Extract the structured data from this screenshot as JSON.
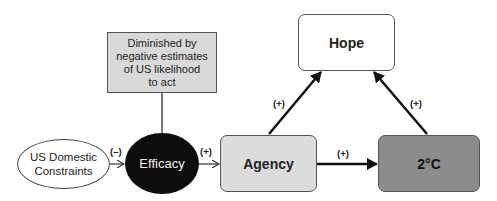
{
  "diagram": {
    "nodes": {
      "note": {
        "lines": [
          "Diminished by",
          "negative estimates",
          "of US likelihood",
          "to act"
        ]
      },
      "constraints": {
        "lines": [
          "US Domestic",
          "Constraints"
        ]
      },
      "efficacy": {
        "label": "Efficacy"
      },
      "agency": {
        "label": "Agency"
      },
      "temp": {
        "label": "2°C"
      },
      "hope": {
        "label": "Hope"
      }
    },
    "edges": [
      {
        "from": "US Domestic Constraints",
        "to": "Efficacy",
        "sign": "(–)"
      },
      {
        "from": "Efficacy",
        "to": "Agency",
        "sign": "(+)"
      },
      {
        "from": "Agency",
        "to": "2°C",
        "sign": "(+)"
      },
      {
        "from": "Agency",
        "to": "Hope",
        "sign": "(+)"
      },
      {
        "from": "2°C",
        "to": "Hope",
        "sign": "(+)"
      },
      {
        "from": "Diminished by negative estimates of US likelihood to act",
        "to": "Efficacy",
        "sign": ""
      }
    ],
    "colors": {
      "note_fill": "#d9d9d9",
      "efficacy_fill": "#0d0d0d",
      "agency_fill": "#dcdcdc",
      "temp_fill": "#8c8c8c",
      "hope_fill": "#ffffff"
    }
  }
}
